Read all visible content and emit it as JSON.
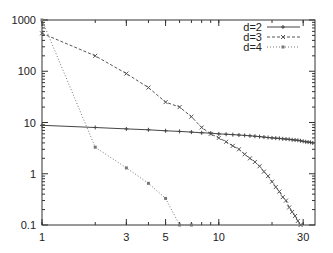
{
  "chart_data": {
    "type": "line",
    "title": "",
    "xlabel": "",
    "ylabel": "",
    "xscale": "log",
    "yscale": "log",
    "xlim": [
      1,
      35
    ],
    "ylim": [
      0.1,
      1000
    ],
    "x_ticks": [
      "1",
      "3",
      "5",
      "10",
      "30"
    ],
    "y_ticks": [
      "1000",
      "100",
      "10",
      "1",
      "0.1"
    ],
    "grid": false,
    "legend_position": "top-right",
    "series": [
      {
        "name": "d=2",
        "style": "solid-plus",
        "x": [
          1,
          2,
          3,
          4,
          5,
          6,
          7,
          8,
          9,
          10,
          11,
          12,
          13,
          14,
          15,
          16,
          17,
          18,
          19,
          20,
          21,
          22,
          23,
          24,
          25,
          26,
          27,
          28,
          29,
          30,
          31,
          32,
          33,
          34
        ],
        "values": [
          8.8,
          8.0,
          7.5,
          7.2,
          6.9,
          6.7,
          6.5,
          6.3,
          6.2,
          6.0,
          5.9,
          5.8,
          5.7,
          5.6,
          5.5,
          5.4,
          5.3,
          5.2,
          5.1,
          5.0,
          4.95,
          4.9,
          4.8,
          4.75,
          4.7,
          4.6,
          4.55,
          4.5,
          4.4,
          4.3,
          4.2,
          4.15,
          4.1,
          4.0
        ]
      },
      {
        "name": "d=3",
        "style": "dashed-x",
        "x": [
          1,
          2,
          3,
          4,
          5,
          6,
          7,
          8,
          9,
          10,
          11,
          12,
          13,
          14,
          15,
          16,
          17,
          18,
          19,
          20,
          21,
          22,
          23,
          24,
          25,
          26,
          27,
          28,
          29
        ],
        "values": [
          550,
          200,
          90,
          48,
          25,
          20,
          13,
          8,
          6,
          5,
          4.2,
          3.5,
          3.0,
          2.4,
          2.0,
          1.7,
          1.4,
          1.1,
          0.9,
          0.7,
          0.55,
          0.45,
          0.35,
          0.3,
          0.22,
          0.18,
          0.15,
          0.12,
          0.1
        ]
      },
      {
        "name": "d=4",
        "style": "dotted-square",
        "x": [
          1,
          2,
          3,
          4,
          5,
          6,
          7
        ],
        "values": [
          1000,
          3.3,
          1.3,
          0.65,
          0.33,
          0.1,
          0.1
        ]
      }
    ]
  }
}
